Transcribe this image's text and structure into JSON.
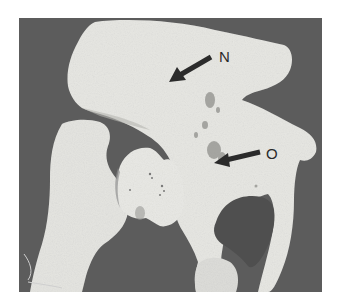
{
  "figure": {
    "background_color": "#ffffff",
    "photo_background_color": "#5c5c5c",
    "bone_color": "#e8e8e4",
    "annotations": [
      {
        "label": "N",
        "arrow_tail": [
          211,
          57
        ],
        "arrow_head": [
          169,
          82
        ],
        "label_pos": [
          219,
          49
        ]
      },
      {
        "label": "O",
        "arrow_tail": [
          260,
          152
        ],
        "arrow_head": [
          214,
          163
        ],
        "label_pos": [
          266,
          146
        ]
      }
    ]
  }
}
